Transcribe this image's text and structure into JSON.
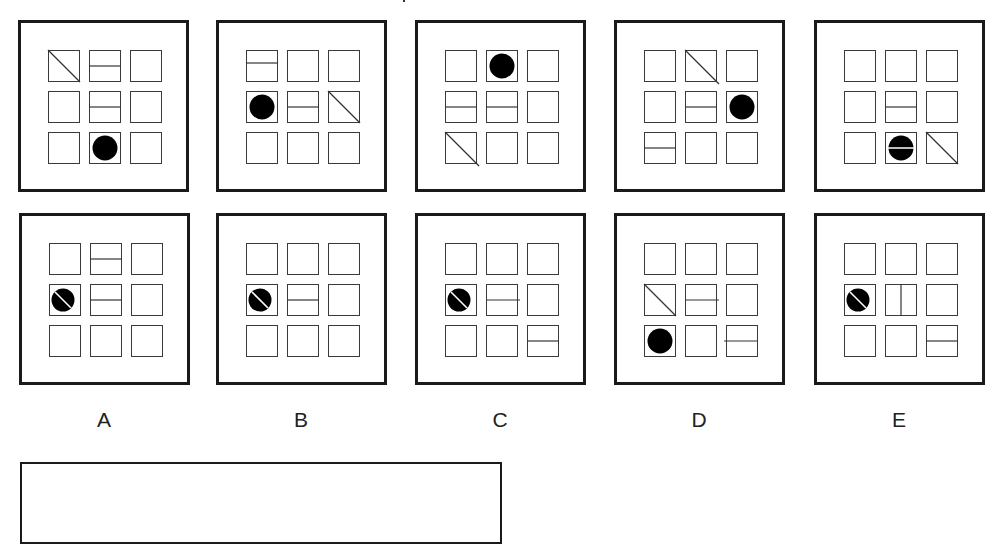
{
  "puzzle": {
    "type": "matrix-reasoning",
    "question_panels": [
      {
        "id": "Q1",
        "left": 18,
        "top": 20,
        "cells": [
          [
            "diagonal",
            "horizontal-line",
            "empty"
          ],
          [
            "empty",
            "horizontal-line",
            "empty"
          ],
          [
            "empty",
            "filled-circle",
            "empty"
          ]
        ]
      },
      {
        "id": "Q2",
        "left": 216,
        "top": 20,
        "cells": [
          [
            "horizontal-line-high",
            "empty",
            "empty"
          ],
          [
            "filled-circle",
            "horizontal-line",
            "diagonal"
          ],
          [
            "empty",
            "empty",
            "empty"
          ]
        ]
      },
      {
        "id": "Q3",
        "left": 415,
        "top": 20,
        "cells": [
          [
            "empty",
            "filled-circle",
            "empty"
          ],
          [
            "horizontal-line",
            "horizontal-line",
            "empty"
          ],
          [
            "diagonal-overflow",
            "empty",
            "empty"
          ]
        ]
      },
      {
        "id": "Q4",
        "left": 614,
        "top": 20,
        "cells": [
          [
            "empty",
            "diagonal-overflow",
            "empty"
          ],
          [
            "empty",
            "horizontal-line",
            "filled-circle"
          ],
          [
            "horizontal-line",
            "empty",
            "empty"
          ]
        ]
      },
      {
        "id": "Q5",
        "left": 814,
        "top": 20,
        "cells": [
          [
            "empty",
            "empty",
            "empty"
          ],
          [
            "empty",
            "horizontal-line",
            "empty"
          ],
          [
            "empty",
            "circle-with-horizontal-line",
            "diagonal"
          ]
        ]
      }
    ],
    "answer_options": [
      {
        "label": "A",
        "left": 19,
        "top": 213,
        "cells": [
          [
            "empty",
            "horizontal-line",
            "empty"
          ],
          [
            "circle-with-diagonal",
            "horizontal-line",
            "empty"
          ],
          [
            "empty",
            "empty",
            "empty"
          ]
        ]
      },
      {
        "label": "B",
        "left": 216,
        "top": 213,
        "cells": [
          [
            "empty",
            "empty",
            "empty"
          ],
          [
            "circle-with-diagonal",
            "horizontal-line",
            "empty"
          ],
          [
            "empty",
            "empty",
            "empty"
          ]
        ]
      },
      {
        "label": "C",
        "left": 415,
        "top": 213,
        "cells": [
          [
            "empty",
            "empty",
            "empty"
          ],
          [
            "circle-with-diagonal",
            "horizontal-line-overflow",
            "empty"
          ],
          [
            "empty",
            "empty",
            "horizontal-line"
          ]
        ]
      },
      {
        "label": "D",
        "left": 614,
        "top": 213,
        "cells": [
          [
            "empty",
            "empty",
            "empty"
          ],
          [
            "diagonal",
            "horizontal-line-overflow",
            "empty"
          ],
          [
            "filled-circle",
            "empty",
            "horizontal-line-overflow-left"
          ]
        ]
      },
      {
        "label": "E",
        "left": 814,
        "top": 213,
        "cells": [
          [
            "empty",
            "empty",
            "empty"
          ],
          [
            "circle-with-diagonal",
            "vertical-line",
            "empty"
          ],
          [
            "empty",
            "empty",
            "horizontal-line"
          ]
        ]
      }
    ],
    "answer_box": {
      "value": ""
    },
    "colors": {
      "stroke": "#1a1a1a",
      "fill": "#000000",
      "background": "#ffffff"
    }
  }
}
